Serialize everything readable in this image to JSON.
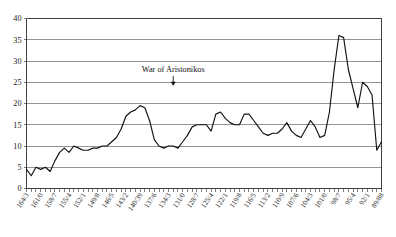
{
  "chart_data": {
    "type": "line",
    "title": "",
    "subtitle": "",
    "xlabel": "",
    "ylabel": "",
    "ylim": [
      0,
      40
    ],
    "yticks": [
      0,
      5,
      10,
      15,
      20,
      25,
      30,
      35,
      40
    ],
    "grid": true,
    "legend": false,
    "legend_position": "none",
    "line_color": "#111111",
    "grid_color": "#4d4d4d",
    "axis_color": "#2b2b2b",
    "annotations": [
      {
        "text": "War of Aristonikos",
        "x": "133/2",
        "arrow": "down",
        "y_text": 27.5
      }
    ],
    "x_tick_labels": [
      "164/3",
      "161/0",
      "158/7",
      "155/4",
      "152/1",
      "149/8",
      "146/5",
      "143/2",
      "140/39",
      "137/6",
      "134/3",
      "131/0",
      "128/7",
      "125/4",
      "122/1",
      "119/8",
      "116/5",
      "113/2",
      "110/9",
      "107/6",
      "104/3",
      "101/0",
      "98/7",
      "95/4",
      "92/1",
      "89/88"
    ],
    "x_label_interval": 3,
    "x": [
      "164/3",
      "163/2",
      "162/1",
      "161/0",
      "160/59",
      "159/8",
      "158/7",
      "157/6",
      "156/5",
      "155/4",
      "154/3",
      "153/2",
      "152/1",
      "151/0",
      "150/49",
      "149/8",
      "148/7",
      "147/6",
      "146/5",
      "145/4",
      "144/3",
      "143/2",
      "142/1",
      "141/0",
      "140/39",
      "139/8",
      "138/7",
      "137/6",
      "136/5",
      "135/4",
      "134/3",
      "133/2",
      "132/1",
      "131/0",
      "130/29",
      "129/8",
      "128/7",
      "127/6",
      "126/5",
      "125/4",
      "124/3",
      "123/2",
      "122/1",
      "121/0",
      "120/19",
      "119/8",
      "118/7",
      "117/6",
      "116/5",
      "115/4",
      "114/3",
      "113/2",
      "112/1",
      "111/0",
      "110/9",
      "109/8",
      "108/7",
      "107/6",
      "106/5",
      "105/4",
      "104/3",
      "103/2",
      "102/1",
      "101/0",
      "100/99",
      "99/8",
      "98/7",
      "97/6",
      "96/5",
      "95/4",
      "94/3",
      "93/2",
      "92/1",
      "91/0",
      "90/89",
      "89/88"
    ],
    "values": [
      4.5,
      3.0,
      5.0,
      4.5,
      5.0,
      4.0,
      6.5,
      8.5,
      9.5,
      8.5,
      10.0,
      9.5,
      9.0,
      9.0,
      9.5,
      9.5,
      10.0,
      10.0,
      11.0,
      12.0,
      14.0,
      17.0,
      18.0,
      18.5,
      19.5,
      19.0,
      16.0,
      11.5,
      10.0,
      9.5,
      10.0,
      10.0,
      9.5,
      11.0,
      12.5,
      14.5,
      15.0,
      15.0,
      15.0,
      13.5,
      17.5,
      18.0,
      16.5,
      15.5,
      15.0,
      15.0,
      17.5,
      17.5,
      16.0,
      14.5,
      13.0,
      12.5,
      13.0,
      13.0,
      14.0,
      15.5,
      13.5,
      12.5,
      12.0,
      14.0,
      16.0,
      14.5,
      12.0,
      12.5,
      18.0,
      28.0,
      36.0,
      35.5,
      28.0,
      23.5,
      19.0,
      25.0,
      24.0,
      22.0,
      9.0,
      11.0
    ]
  }
}
